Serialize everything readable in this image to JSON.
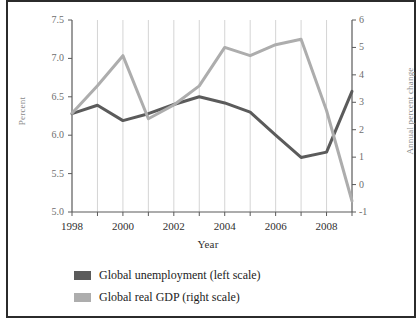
{
  "chart_data": {
    "type": "line",
    "title": "",
    "xlabel": "Year",
    "ylabel": "Percent",
    "ylabel_right": "Annual percent change",
    "x": [
      1998,
      1999,
      2000,
      2001,
      2002,
      2003,
      2004,
      2005,
      2006,
      2007,
      2008,
      2009
    ],
    "xlim": [
      1998,
      2009
    ],
    "xtick_labels": [
      "1998",
      "2000",
      "2002",
      "2004",
      "2006",
      "2008"
    ],
    "xtick_values": [
      1998,
      2000,
      2002,
      2004,
      2006,
      2008
    ],
    "ylim": [
      5.0,
      7.5
    ],
    "ytick_labels": [
      "7.5",
      "7.0",
      "6.5",
      "6.0",
      "5.5",
      "5.0"
    ],
    "ytick_values": [
      7.5,
      7.0,
      6.5,
      6.0,
      5.5,
      5.0
    ],
    "ylim_right": [
      -1,
      6
    ],
    "ytick_labels_right": [
      "6",
      "5",
      "4",
      "3",
      "2",
      "1",
      "0",
      "-1"
    ],
    "ytick_values_right": [
      6,
      5,
      4,
      3,
      2,
      1,
      0,
      -1
    ],
    "grid": "vertical",
    "legend_position": "bottom-left",
    "series": [
      {
        "name": "Global unemployment (left scale)",
        "axis": "left",
        "color": "#5b5b5b",
        "values": [
          6.28,
          6.39,
          6.19,
          6.28,
          6.4,
          6.5,
          6.42,
          6.3,
          6.0,
          5.71,
          5.78,
          6.57
        ]
      },
      {
        "name": "Global real GDP (right scale)",
        "axis": "right",
        "color": "#adadad",
        "values": [
          2.6,
          3.6,
          4.7,
          2.4,
          2.9,
          3.6,
          5.0,
          4.7,
          5.1,
          5.3,
          2.7,
          -0.6
        ]
      }
    ]
  },
  "legend": {
    "items": [
      {
        "label": "Global unemployment (left scale)",
        "color": "#5b5b5b",
        "swatch": "legend-swatch-unemployment"
      },
      {
        "label": "Global real GDP (right scale)",
        "color": "#adadad",
        "swatch": "legend-swatch-gdp"
      }
    ]
  },
  "axes": {
    "left_title": "Percent",
    "right_title": "Annual percent change",
    "bottom_title": "Year"
  }
}
